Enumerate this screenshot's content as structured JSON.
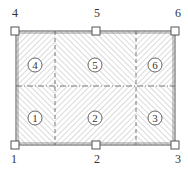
{
  "diagram": {
    "type": "slab-panel-hatching",
    "frame": {
      "left": 16,
      "right": 175,
      "top": 31,
      "bottom": 145
    },
    "dividers": {
      "vertical_x": [
        55,
        136
      ],
      "horizontal_y": 86
    },
    "nodes": [
      {
        "id": "1",
        "label": "1",
        "x": 15,
        "y": 145,
        "label_x": 14,
        "label_y": 163
      },
      {
        "id": "2",
        "label": "2",
        "x": 96,
        "y": 145,
        "label_x": 97,
        "label_y": 163
      },
      {
        "id": "3",
        "label": "3",
        "x": 175,
        "y": 145,
        "label_x": 178,
        "label_y": 163
      },
      {
        "id": "4",
        "label": "4",
        "x": 15,
        "y": 31,
        "label_x": 15,
        "label_y": 17
      },
      {
        "id": "5",
        "label": "5",
        "x": 96,
        "y": 31,
        "label_x": 97,
        "label_y": 17
      },
      {
        "id": "6",
        "label": "6",
        "x": 175,
        "y": 31,
        "label_x": 178,
        "label_y": 17
      }
    ],
    "regions": [
      {
        "id": "1",
        "label": "1",
        "cx": 35,
        "cy": 118,
        "hatch": "back"
      },
      {
        "id": "2",
        "label": "2",
        "cx": 95,
        "cy": 118,
        "hatch": "fwd"
      },
      {
        "id": "3",
        "label": "3",
        "cx": 155,
        "cy": 118,
        "hatch": "back"
      },
      {
        "id": "4",
        "label": "4",
        "cx": 35,
        "cy": 65,
        "hatch": "fwd"
      },
      {
        "id": "5",
        "label": "5",
        "cx": 95,
        "cy": 65,
        "hatch": "back"
      },
      {
        "id": "6",
        "label": "6",
        "cx": 155,
        "cy": 65,
        "hatch": "fwd"
      }
    ],
    "colors": {
      "line": "#555555",
      "hatch": "#b8b8b8",
      "text": "#333333",
      "background": "#ffffff"
    }
  }
}
